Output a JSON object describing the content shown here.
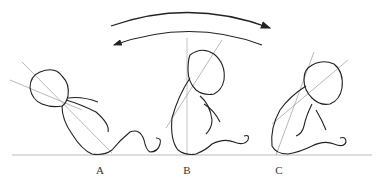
{
  "figure": {
    "labels": [
      {
        "id": "A",
        "text": "A",
        "x": 100,
        "y": 164
      },
      {
        "id": "B",
        "text": "B",
        "x": 187,
        "y": 164
      },
      {
        "id": "C",
        "text": "C",
        "x": 279,
        "y": 164
      }
    ],
    "arrows": [
      {
        "direction": "right",
        "description": "forward arc arrow"
      },
      {
        "direction": "left",
        "description": "backward arc arrow"
      }
    ],
    "colors": {
      "line": "#222222",
      "guide": "#9a9a9a",
      "ground": "#bbbbbb"
    }
  }
}
